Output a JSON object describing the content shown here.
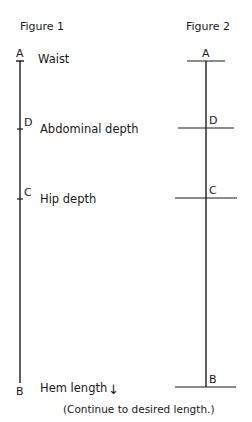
{
  "figure1": {
    "title": "Figure 1",
    "points": [
      {
        "letter": "A",
        "label": "Waist"
      },
      {
        "letter": "D",
        "label": "Abdominal depth"
      },
      {
        "letter": "C",
        "label": "Hip depth"
      },
      {
        "letter": "B",
        "label": "Hem length"
      }
    ],
    "arrow": "↓",
    "note": "(Continue to desired length.)"
  },
  "figure2": {
    "title": "Figure 2",
    "points": [
      {
        "letter": "A"
      },
      {
        "letter": "D"
      },
      {
        "letter": "C"
      },
      {
        "letter": "B"
      }
    ]
  }
}
